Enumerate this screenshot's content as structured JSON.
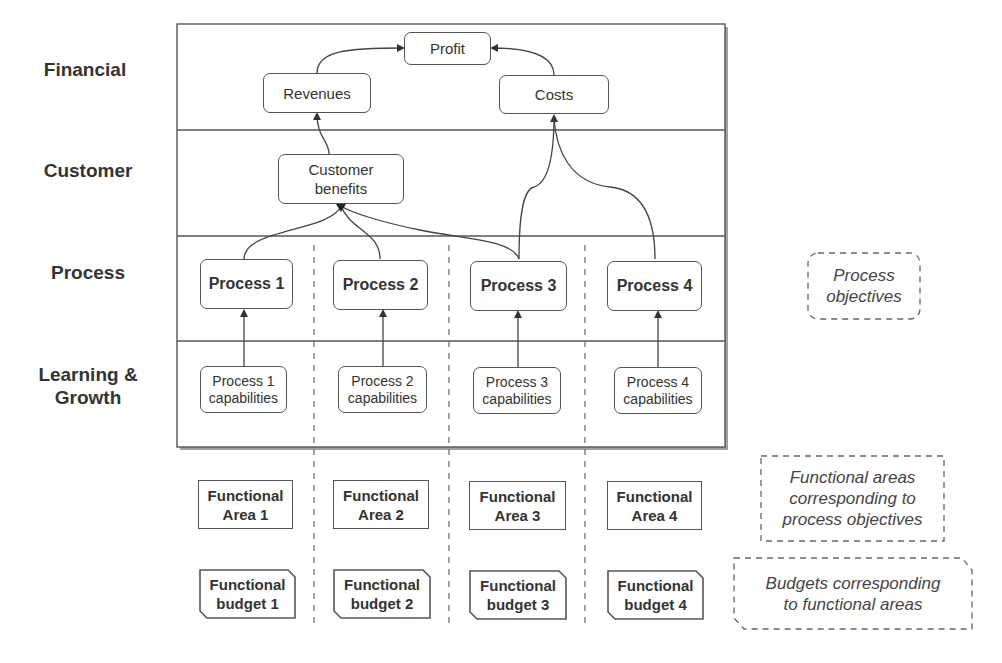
{
  "perspectives": [
    {
      "label": "Financial"
    },
    {
      "label": "Customer"
    },
    {
      "label": "Process"
    },
    {
      "label": "Learning &\nGrowth"
    }
  ],
  "financial": {
    "profit": "Profit",
    "revenues": "Revenues",
    "costs": "Costs"
  },
  "customer": {
    "benefits": "Customer\nbenefits"
  },
  "processes": [
    {
      "label": "Process 1",
      "capability": "Process 1\ncapabilities",
      "area": "Functional\nArea 1",
      "budget": "Functional\nbudget 1"
    },
    {
      "label": "Process 2",
      "capability": "Process 2\ncapabilities",
      "area": "Functional\nArea 2",
      "budget": "Functional\nbudget 2"
    },
    {
      "label": "Process 3",
      "capability": "Process 3\ncapabilities",
      "area": "Functional\nArea 3",
      "budget": "Functional\nbudget 3"
    },
    {
      "label": "Process 4",
      "capability": "Process 4\ncapabilities",
      "area": "Functional\nArea 4",
      "budget": "Functional\nbudget 4"
    }
  ],
  "annotations": {
    "process_objectives": "Process\nobjectives",
    "functional_areas": "Functional areas\ncorresponding to\nprocess objectives",
    "budgets": "Budgets corresponding\nto functional areas"
  },
  "colors": {
    "line": "#555555",
    "frame_shadow": "#9a9a9a",
    "dashed": "#666666"
  }
}
